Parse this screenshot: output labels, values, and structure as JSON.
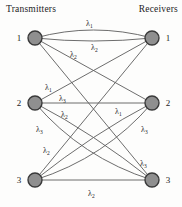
{
  "figure_title_left": "Transmitters",
  "figure_title_right": "Receivers",
  "lambda_symbol": "λ",
  "colors": {
    "background": "#fdfdfc",
    "node_fill": "#8f8f8f",
    "node_stroke": "#3a3a3a",
    "edge_stroke": "#5c5c5c",
    "text": "#1c1c1c"
  },
  "diagram": {
    "node_radius": 7,
    "transmitters": [
      {
        "id": "T1",
        "label": "1",
        "x": 35,
        "y": 38
      },
      {
        "id": "T2",
        "label": "2",
        "x": 35,
        "y": 103
      },
      {
        "id": "T3",
        "label": "3",
        "x": 35,
        "y": 180
      }
    ],
    "receivers": [
      {
        "id": "R1",
        "label": "1",
        "x": 152,
        "y": 38
      },
      {
        "id": "R2",
        "label": "2",
        "x": 152,
        "y": 103
      },
      {
        "id": "R3",
        "label": "3",
        "x": 152,
        "y": 180
      }
    ],
    "edges": [
      {
        "from": "T1",
        "to": "R1",
        "wavelength_sub": "1",
        "bend": [
          0,
          -16
        ],
        "label": {
          "x": 86,
          "y": 26
        }
      },
      {
        "from": "T1",
        "to": "R1",
        "wavelength_sub": "2",
        "bend": [
          0,
          6
        ],
        "label": {
          "x": 91,
          "y": 50
        }
      },
      {
        "from": "T1",
        "to": "R2",
        "wavelength_sub": "2",
        "bend": [
          0,
          0
        ],
        "label": {
          "x": 70,
          "y": 57
        }
      },
      {
        "from": "T1",
        "to": "R3",
        "wavelength_sub": "3",
        "bend": [
          0,
          0
        ],
        "label": {
          "x": 140,
          "y": 166
        }
      },
      {
        "from": "T2",
        "to": "R1",
        "wavelength_sub": "1",
        "bend": [
          0,
          0
        ],
        "label": {
          "x": 45,
          "y": 90
        }
      },
      {
        "from": "T2",
        "to": "R2",
        "wavelength_sub": "3",
        "bend": [
          0,
          0
        ],
        "label": {
          "x": 59,
          "y": 101
        }
      },
      {
        "from": "T2",
        "to": "R3",
        "wavelength_sub": "2",
        "bend": [
          0,
          -8
        ],
        "label": {
          "x": 61,
          "y": 117
        }
      },
      {
        "from": "T2",
        "to": "R3",
        "wavelength_sub": "3",
        "bend": [
          -12,
          16
        ],
        "label": {
          "x": 36,
          "y": 132
        }
      },
      {
        "from": "T3",
        "to": "R1",
        "wavelength_sub": "2",
        "bend": [
          0,
          0
        ],
        "label": {
          "x": 43,
          "y": 153
        }
      },
      {
        "from": "T3",
        "to": "R2",
        "wavelength_sub": "1",
        "bend": [
          0,
          -8
        ],
        "label": {
          "x": 115,
          "y": 114
        }
      },
      {
        "from": "T3",
        "to": "R2",
        "wavelength_sub": "3",
        "bend": [
          12,
          16
        ],
        "label": {
          "x": 141,
          "y": 132
        }
      },
      {
        "from": "T3",
        "to": "R3",
        "wavelength_sub": "2",
        "bend": [
          0,
          0
        ],
        "label": {
          "x": 88,
          "y": 196
        }
      }
    ]
  }
}
